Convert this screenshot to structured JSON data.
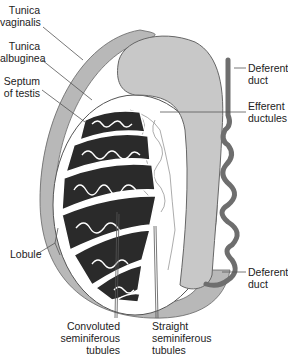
{
  "figure": {
    "colors": {
      "tunica_vaginalis": "#b8b8b8",
      "lobule_fill": "#2a2a2a",
      "tubule_line": "#ffffff",
      "duct": "#6e6e6e",
      "epididymis": "#c8c8c8",
      "label_text": "#222222",
      "leader_line": "#555555"
    }
  },
  "labels": {
    "tunica_vaginalis": "Tunica\nvaginalis",
    "tunica_albuginea": "Tunica\nalbuginea",
    "septum_of_testis": "Septum\nof testis",
    "lobule": "Lobule",
    "deferent_duct_top": "Deferent\nduct",
    "efferent_ductules": "Efferent\nductules",
    "deferent_duct_bottom": "Deferent\nduct",
    "convoluted_tubules": "Convoluted\nseminiferous\ntubules",
    "straight_tubules": "Straight\nseminiferous\ntubules"
  }
}
